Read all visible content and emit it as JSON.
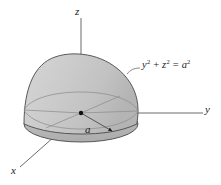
{
  "figure": {
    "background_color": "#ffffff",
    "width": 221,
    "height": 185
  },
  "axes": {
    "z": {
      "label": "z",
      "icon": "axis-z-icon",
      "orientation": "vertical"
    },
    "y": {
      "label": "y",
      "icon": "axis-y-icon",
      "orientation": "horizontal-right"
    },
    "x": {
      "label": "x",
      "icon": "axis-x-icon",
      "orientation": "diagonal-lower-left"
    },
    "line_color": "#5a5a5a"
  },
  "solid": {
    "name": "hemisphere",
    "surface_color": "#c8c8c8",
    "base_color": "#b9b9b9",
    "outline_color": "#4a4a4a",
    "equator_color": "#8d8d8d",
    "origin_marker": "origin-dot"
  },
  "annotations": {
    "radius": {
      "label": "a",
      "arrow": "radius-arrow-icon"
    },
    "equation": {
      "lhs_first_var": "y",
      "lhs_first_exp": "2",
      "operator_plus": "+",
      "lhs_second_var": "z",
      "lhs_second_exp": "2",
      "operator_equals": "=",
      "rhs_var": "a",
      "rhs_exp": "2",
      "full_text": "y2 + z2 = a2",
      "leader": "equation-leader-line"
    }
  }
}
